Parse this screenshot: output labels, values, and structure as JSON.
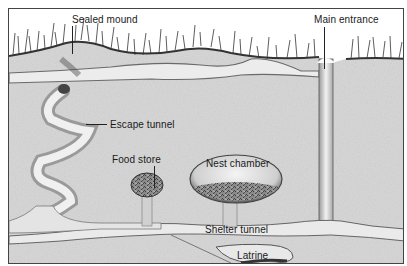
{
  "diagram": {
    "type": "burrow cross-section illustration",
    "labels": {
      "sealed_mound": "Sealed mound",
      "main_entrance": "Main entrance",
      "escape_tunnel": "Escape tunnel",
      "food_store": "Food store",
      "nest_chamber": "Nest chamber",
      "shelter_tunnel": "Shelter tunnel",
      "latrine": "Latrine"
    },
    "colors": {
      "soil": "#d8d8d8",
      "tunnel": "#efefef",
      "shadow": "#6a6a6a",
      "grass": "#3a3a3a",
      "sky": "#ffffff"
    }
  }
}
